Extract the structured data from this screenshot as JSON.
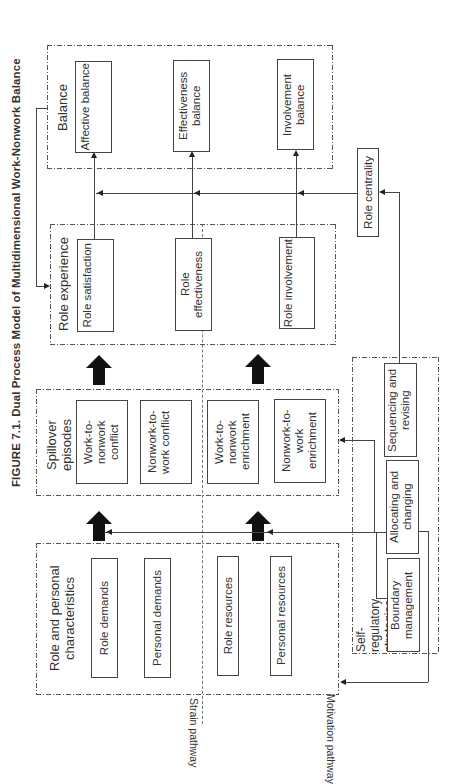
{
  "figure": {
    "title": "FIGURE 7.1.  Dual Process Model of Multidimensional Work-Nonwork Balance"
  },
  "pathways": {
    "strain": "Strain pathway",
    "motivation": "Motivation pathway"
  },
  "groups": {
    "characteristics": {
      "label": "Role and personal characteristics",
      "items": [
        "Role demands",
        "Personal demands",
        "Role resources",
        "Personal resources"
      ]
    },
    "spillover": {
      "label": "Spillover episodes",
      "items": [
        "Work-to-nonwork conflict",
        "Nonwork-to-work conflict",
        "Work-to-nonwork enrichment",
        "Nonwork-to-work enrichment"
      ]
    },
    "role_experience": {
      "label": "Role experience",
      "items": [
        "Role satisfaction",
        "Role effectiveness",
        "Role involvement"
      ]
    },
    "balance": {
      "label": "Balance",
      "items": [
        "Affective balance",
        "Effectiveness balance",
        "Involvement balance"
      ]
    },
    "self_regulatory": {
      "label": "Self-regulatory strategies",
      "items": [
        "Boundary management",
        "Allocating and changing",
        "Sequencing and revising"
      ]
    },
    "moderator": {
      "label": "Role centrality"
    }
  }
}
